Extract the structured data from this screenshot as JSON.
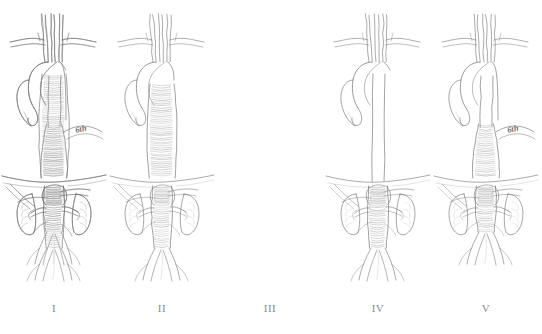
{
  "figure": {
    "background_color": "#ffffff",
    "ink_color": "#7a7a7a",
    "shade_color": "#9a9a9a",
    "panel_count": 5
  },
  "panels": [
    {
      "label": "I",
      "extent_name": "Extent I",
      "description": "Aneurysm from distal aortic arch and proximal descending thoracic aorta to above the renal arteries",
      "annotation": "",
      "has_level_marker": false,
      "aneurysm_segments": [
        "distal-arch",
        "proximal-descending-thoracic",
        "distal-descending-thoracic",
        "suprarenal-abdominal"
      ],
      "thoracic_aneurysm": true,
      "thoracic_aneurysm_top_y": 74,
      "thoracic_aneurysm_bottom_y": 178,
      "abdominal_aneurysm": true,
      "abdominal_aneurysm_top_y": 186,
      "abdominal_aneurysm_bottom_y": 232
    },
    {
      "label": "II",
      "extent_name": "Extent II",
      "description": "Aneurysm from left subclavian artery to below the renal arteries, the most extensive type",
      "annotation": "",
      "has_level_marker": false,
      "aneurysm_segments": [
        "proximal-descending-thoracic",
        "distal-descending-thoracic",
        "suprarenal-abdominal",
        "infrarenal-abdominal"
      ],
      "thoracic_aneurysm": true,
      "thoracic_aneurysm_top_y": 84,
      "thoracic_aneurysm_bottom_y": 178,
      "abdominal_aneurysm": true,
      "abdominal_aneurysm_top_y": 186,
      "abdominal_aneurysm_bottom_y": 248
    },
    {
      "label": "III",
      "extent_name": "Extent III",
      "description": "Aneurysm from distal descending thoracic aorta at the sixth intercostal space to the abdominal aorta",
      "annotation": "6th",
      "has_level_marker": true,
      "level_marker_text": "6th",
      "aneurysm_segments": [
        "distal-descending-thoracic",
        "suprarenal-abdominal",
        "infrarenal-abdominal"
      ],
      "thoracic_aneurysm": true,
      "thoracic_aneurysm_top_y": 124,
      "thoracic_aneurysm_bottom_y": 178,
      "abdominal_aneurysm": true,
      "abdominal_aneurysm_top_y": 186,
      "abdominal_aneurysm_bottom_y": 248
    },
    {
      "label": "IV",
      "extent_name": "Extent IV",
      "description": "Aneurysm limited to the abdominal aorta below the diaphragm, thoracic aorta normal",
      "annotation": "",
      "has_level_marker": false,
      "aneurysm_segments": [
        "suprarenal-abdominal",
        "infrarenal-abdominal"
      ],
      "thoracic_aneurysm": false,
      "thoracic_aneurysm_top_y": 0,
      "thoracic_aneurysm_bottom_y": 0,
      "abdominal_aneurysm": true,
      "abdominal_aneurysm_top_y": 186,
      "abdominal_aneurysm_bottom_y": 248
    },
    {
      "label": "V",
      "extent_name": "Extent V",
      "description": "Aneurysm from distal descending thoracic aorta at the sixth intercostal space to above the renal arteries",
      "annotation": "6th",
      "has_level_marker": true,
      "level_marker_text": "6th",
      "aneurysm_segments": [
        "distal-descending-thoracic",
        "suprarenal-abdominal"
      ],
      "thoracic_aneurysm": true,
      "thoracic_aneurysm_top_y": 124,
      "thoracic_aneurysm_bottom_y": 178,
      "abdominal_aneurysm": true,
      "abdominal_aneurysm_top_y": 186,
      "abdominal_aneurysm_bottom_y": 232
    }
  ],
  "anatomy": {
    "arch_branches": [
      "brachiocephalic-artery",
      "left-common-carotid-artery",
      "left-subclavian-artery"
    ],
    "organs": [
      "left-kidney",
      "right-kidney"
    ],
    "structures": [
      "aortic-arch",
      "ascending-aorta",
      "descending-thoracic-aorta",
      "diaphragm",
      "abdominal-aorta",
      "renal-arteries",
      "celiac-trunk",
      "superior-mesenteric-artery",
      "iliac-bifurcation",
      "common-iliac-arteries"
    ],
    "diaphragm_y": 180
  }
}
